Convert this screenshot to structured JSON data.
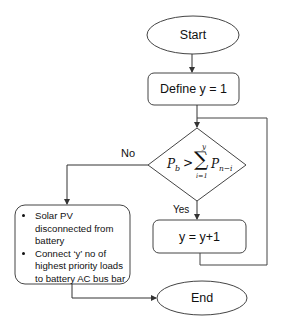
{
  "diagram": {
    "type": "flowchart",
    "nodes": {
      "start": {
        "label": "Start",
        "shape": "ellipse"
      },
      "define": {
        "label": "Define y = 1",
        "shape": "rounded-rect"
      },
      "decision": {
        "shape": "diamond",
        "lhs": "P",
        "lhs_sub": "b",
        "operator": ">",
        "sum_symbol": "∑",
        "sum_upper": "y",
        "sum_lower": "i=1",
        "rhs": "P",
        "rhs_sub": "n−i"
      },
      "increment": {
        "label": "y = y+1",
        "shape": "rounded-rect"
      },
      "action": {
        "shape": "rounded-rect",
        "bullets": [
          "Solar PV disconnected from battery",
          "Connect ‘y’ no of highest priority loads to battery AC bus bar"
        ]
      },
      "end": {
        "label": "End",
        "shape": "ellipse"
      }
    },
    "edges": {
      "no_label": "No",
      "yes_label": "Yes"
    },
    "colors": {
      "stroke": "#333333",
      "background": "#ffffff",
      "text": "#111111"
    }
  }
}
